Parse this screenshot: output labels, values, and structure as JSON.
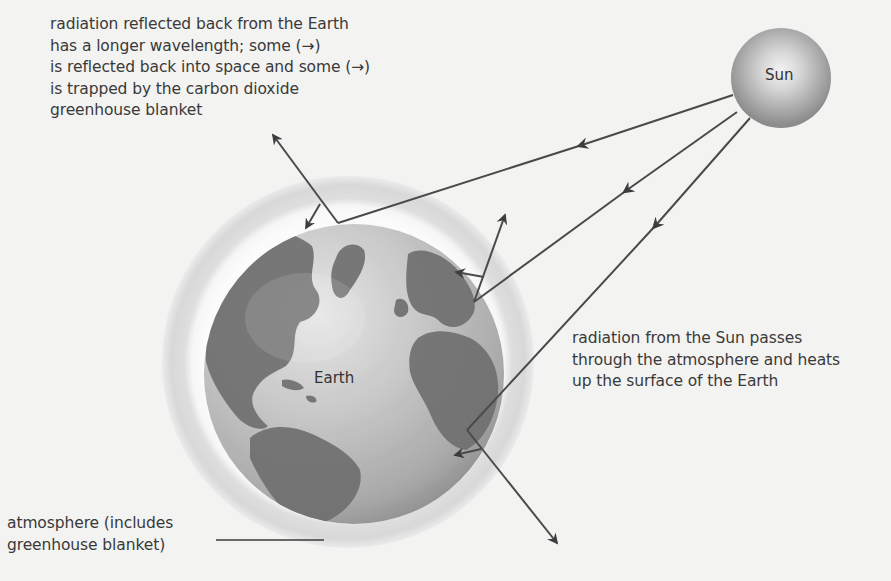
{
  "diagram": {
    "type": "greenhouse-effect",
    "bodies": {
      "sun": {
        "label": "Sun"
      },
      "earth": {
        "label": "Earth"
      }
    },
    "labels": {
      "reflected_radiation": {
        "lines": [
          "radiation reflected back from the Earth",
          "has a longer wavelength; some (→)",
          "is reflected back into space and some (→)",
          "is trapped by the carbon dioxide",
          "greenhouse blanket"
        ]
      },
      "incoming_radiation": {
        "lines": [
          "radiation from the Sun passes",
          "through the atmosphere and heats",
          "up the surface of the Earth"
        ]
      },
      "atmosphere": {
        "lines": [
          "atmosphere (includes",
          "greenhouse blanket)"
        ]
      }
    },
    "arrows": {
      "incoming_rays": 3,
      "escaping_rays": 3,
      "trapped_rays": 3
    },
    "colors": {
      "background": "#f3f3f2",
      "arrow": "#4a4a4a",
      "atmosphere_outer": "#dcdcdc",
      "atmosphere_inner": "#fafafa",
      "ocean": "#c9c9c9",
      "land": "#6e6e6e",
      "sun": "#9b9b9b",
      "text": "#3a3a3a"
    }
  }
}
